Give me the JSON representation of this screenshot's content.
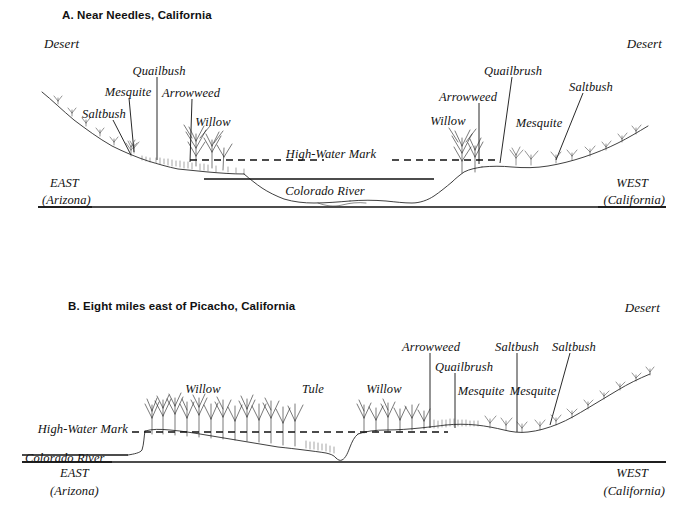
{
  "panels": [
    {
      "id": "panel-a",
      "title": "A.  Near Needles, California",
      "left_region": "Desert",
      "right_region": "Desert",
      "high_water_mark": "High-Water Mark",
      "river": "Colorado River",
      "east": {
        "direction": "EAST",
        "state": "(Arizona)"
      },
      "west": {
        "direction": "WEST",
        "state": "(California)"
      },
      "plant_labels": [
        {
          "name": "Saltbush",
          "side": "east"
        },
        {
          "name": "Mesquite",
          "side": "east"
        },
        {
          "name": "Quailbush",
          "side": "east"
        },
        {
          "name": "Arrowweed",
          "side": "east"
        },
        {
          "name": "Willow",
          "side": "east"
        },
        {
          "name": "Willow",
          "side": "west"
        },
        {
          "name": "Arrowweed",
          "side": "west"
        },
        {
          "name": "Quailbrush",
          "side": "west"
        },
        {
          "name": "Mesquite",
          "side": "west"
        },
        {
          "name": "Saltbush",
          "side": "west"
        }
      ]
    },
    {
      "id": "panel-b",
      "title": "B.  Eight miles east of Picacho, California",
      "right_region": "Desert",
      "high_water_mark": "High-Water Mark",
      "river": "Colorado River",
      "east": {
        "direction": "EAST",
        "state": "(Arizona)"
      },
      "west": {
        "direction": "WEST",
        "state": "(California)"
      },
      "plant_labels": [
        {
          "name": "Willow",
          "side": "east"
        },
        {
          "name": "Tule",
          "side": "middle"
        },
        {
          "name": "Willow",
          "side": "middle"
        },
        {
          "name": "Arrowweed",
          "side": "west"
        },
        {
          "name": "Quailbrush",
          "side": "west"
        },
        {
          "name": "Mesquite",
          "side": "west"
        },
        {
          "name": "Mesquite",
          "side": "west"
        },
        {
          "name": "Saltbush",
          "side": "west"
        },
        {
          "name": "Saltbush",
          "side": "west"
        }
      ]
    }
  ],
  "colors": {
    "ink": "#111111",
    "line": "#2a2a2a",
    "background": "#ffffff"
  }
}
